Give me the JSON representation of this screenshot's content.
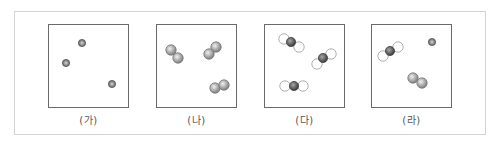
{
  "figure": {
    "panels": [
      {
        "id": "ga",
        "label": "(가)",
        "description": "three separate single atoms",
        "particles": [
          {
            "type": "atom",
            "element": "X"
          },
          {
            "type": "atom",
            "element": "X"
          },
          {
            "type": "atom",
            "element": "X"
          }
        ]
      },
      {
        "id": "na",
        "label": "(나)",
        "description": "three diatomic molecules of the same element",
        "particles": [
          {
            "type": "diatomic",
            "element": "Y"
          },
          {
            "type": "diatomic",
            "element": "Y"
          },
          {
            "type": "diatomic",
            "element": "Y"
          }
        ]
      },
      {
        "id": "da",
        "label": "(다)",
        "description": "three triatomic compound molecules (dark center atom, two light outer atoms)",
        "particles": [
          {
            "type": "triatomic",
            "center": "dark",
            "outer": "light"
          },
          {
            "type": "triatomic",
            "center": "dark",
            "outer": "light"
          },
          {
            "type": "triatomic",
            "center": "dark",
            "outer": "light"
          }
        ]
      },
      {
        "id": "ra",
        "label": "(라)",
        "description": "mixture: one triatomic molecule, one single atom, one diatomic molecule",
        "particles": [
          {
            "type": "triatomic",
            "center": "dark",
            "outer": "light"
          },
          {
            "type": "atom",
            "element": "X"
          },
          {
            "type": "diatomic",
            "element": "Y"
          }
        ]
      }
    ],
    "colors": {
      "dark_atom": "#6b6b6b",
      "medium_atom": "#9a9a9a",
      "light_atom": "#ffffff",
      "panel_border": "#6a6a6a",
      "frame_border": "#d4d4d4"
    }
  }
}
